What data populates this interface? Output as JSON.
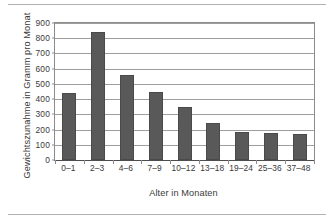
{
  "chart_data": {
    "type": "bar",
    "title": "",
    "subtitle": "",
    "categories": [
      "0–1",
      "2–3",
      "4–6",
      "7–9",
      "10–12",
      "13–18",
      "19–24",
      "25–36",
      "37–48"
    ],
    "values": [
      440,
      840,
      560,
      445,
      348,
      240,
      187,
      178,
      172
    ],
    "xlabel": "Alter in Monaten",
    "ylabel": "Gewichtszunahme in Gramm pro Monat",
    "ylim": [
      0,
      900
    ],
    "ytick_labels": [
      "0",
      "100",
      "200",
      "300",
      "400",
      "500",
      "600",
      "700",
      "800",
      "900"
    ],
    "ytick_values": [
      0,
      100,
      200,
      300,
      400,
      500,
      600,
      700,
      800,
      900
    ],
    "grid": true,
    "legend": false,
    "legend_position": "none",
    "bar_color": "#595959",
    "grid_color": "#9e9e9e",
    "axis_color": "#8c8c8c",
    "text_color": "#3a3a3a",
    "background": "#ffffff"
  }
}
